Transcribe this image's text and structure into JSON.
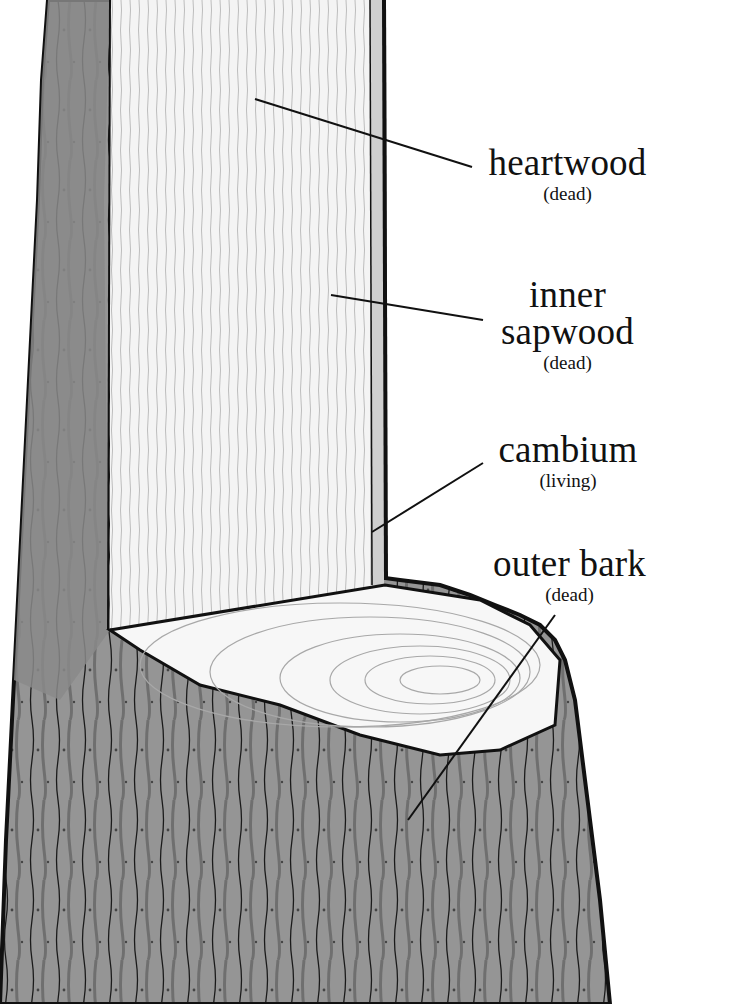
{
  "diagram": {
    "colors": {
      "background": "#ffffff",
      "bark_dark": "#7f7f7f",
      "bark_mid": "#9a9a9a",
      "wood_light": "#f2f2f2",
      "outline": "#111111"
    },
    "labels": [
      {
        "id": "heartwood",
        "name": "heartwood",
        "state": "(dead)"
      },
      {
        "id": "inner-sapwood",
        "name_line1": "inner",
        "name_line2": "sapwood",
        "state": "(dead)"
      },
      {
        "id": "cambium",
        "name": "cambium",
        "state": "(living)"
      },
      {
        "id": "outer-bark",
        "name": "outer bark",
        "state": "(dead)"
      }
    ]
  }
}
